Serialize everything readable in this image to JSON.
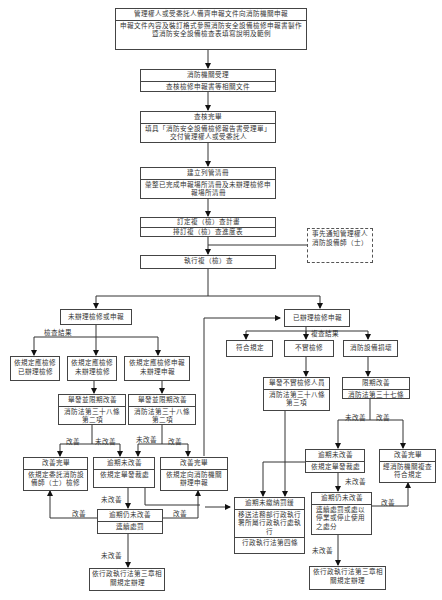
{
  "nodes": {
    "n1": {
      "title": "管理權人或受委託人備齊申報文件向消防機關申報",
      "body": "申報文件內容及裝訂格式參照消防安全設備檢修申報書製作暨消防安全設備檢查表填寫說明及範例"
    },
    "n2": {
      "title": "消防機關受理",
      "body": "查核檢修申報書等相關文件"
    },
    "n3": {
      "title": "查核完畢",
      "body": "填具「消防安全設備檢修報告書受理單」交付管理權人或受委託人"
    },
    "n4": {
      "title": "建立列管清冊",
      "body": "彙整已完成申報場所清冊及未辦理檢修申報場所清冊"
    },
    "n5": {
      "title": "訂定複（檢）查計畫",
      "body": "排訂複（檢）查進度表"
    },
    "notify": {
      "text": "事先通知管理權人消防設備師（士）"
    },
    "n6": {
      "title": "執行複（檢）查"
    },
    "left_branch": {
      "head": "未辦理檢修或申報",
      "result_label": "檢查結果",
      "a": "依規定應檢修已辦理檢修",
      "b": "依規定應檢修未辦理檢修",
      "c": "依規定應檢修申報未辦理申報",
      "b_fine": {
        "title": "舉發並限期改善",
        "body": "消防法第三十八條第二項"
      },
      "c_fine": {
        "title": "舉發並限期改善",
        "body": "消防法第三十八條第二項"
      },
      "done_a": {
        "title": "改善完畢",
        "body": "依規定委託消防設備師（士）檢修"
      },
      "overdue": {
        "title": "逾期未改善",
        "body": "依規定舉發裁處"
      },
      "done_c": {
        "title": "改善完畢",
        "body": "依規定向消防機關辦理申報"
      },
      "still": {
        "title": "逾期仍未改善",
        "body": "連續處罰"
      },
      "final": "依行政執行法第三章相關規定辦理"
    },
    "right_branch": {
      "head": "已辦理檢修申報",
      "result_label": "複查結果",
      "ok": "符合規定",
      "false": "不實檢修",
      "broken": "消防設備損壞",
      "false_fine": {
        "title": "舉發不實檢修人員",
        "body": "消防法第三十八條第三項"
      },
      "deadline": {
        "title": "限期改善",
        "body": "消防法第三十七條"
      },
      "overdue": {
        "title": "逾期未改善",
        "body": "依規定舉發裁處"
      },
      "done": {
        "title": "改善完畢",
        "body": "經消防機關複查符合規定"
      },
      "still": {
        "title": "逾期仍未改善",
        "body": "連續處罰或處以停業或停止使用之處分"
      },
      "final": "依行政執行法第三章相關規定辦理"
    },
    "unpaid": {
      "title": "逾期未繳納罰鍰",
      "body": "移送法務部行政執行署所屬行政執行處執行",
      "footer": "行政執行法第四條"
    }
  },
  "edge_labels": {
    "improved": "改善",
    "not_improved": "未改善"
  }
}
